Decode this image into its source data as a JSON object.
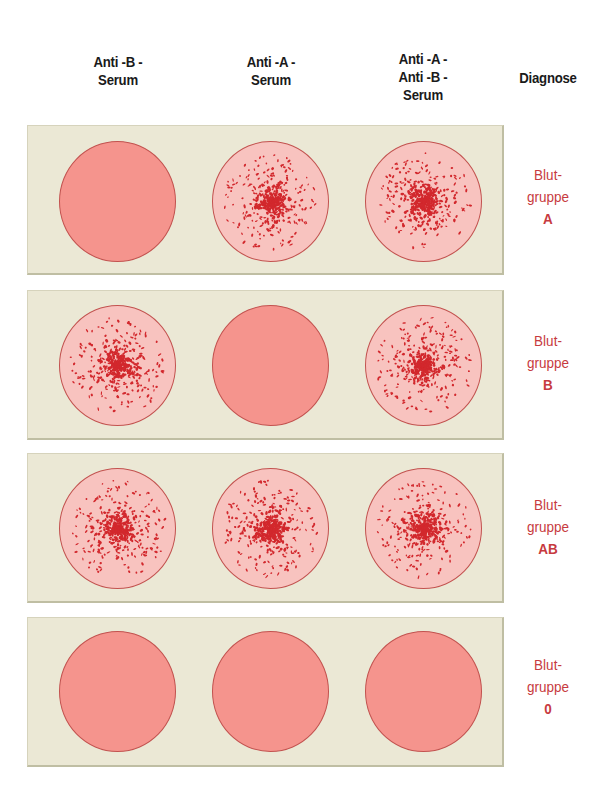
{
  "headers": {
    "col1": [
      "Anti -B -",
      "Serum"
    ],
    "col2": [
      "Anti -A -",
      "Serum"
    ],
    "col3": [
      "Anti -A -",
      "Anti -B -",
      "Serum"
    ],
    "diagnosis": "Diagnose"
  },
  "colors": {
    "panel": "#ebe8d5",
    "negative_well": "#f5948d",
    "positive_well": "#f8c3bf",
    "agglutinate": "#d2282d",
    "diagnosis_text": "#c73a40"
  },
  "rows": [
    {
      "wells": [
        {
          "serum": "Anti-B",
          "agglutination": false
        },
        {
          "serum": "Anti-A",
          "agglutination": true
        },
        {
          "serum": "Anti-A + Anti-B",
          "agglutination": true
        }
      ],
      "diagnosis": {
        "line1": "Blut-",
        "line2": "gruppe",
        "group": "A"
      }
    },
    {
      "wells": [
        {
          "serum": "Anti-B",
          "agglutination": true
        },
        {
          "serum": "Anti-A",
          "agglutination": false
        },
        {
          "serum": "Anti-A + Anti-B",
          "agglutination": true
        }
      ],
      "diagnosis": {
        "line1": "Blut-",
        "line2": "gruppe",
        "group": "B"
      }
    },
    {
      "wells": [
        {
          "serum": "Anti-B",
          "agglutination": true
        },
        {
          "serum": "Anti-A",
          "agglutination": true
        },
        {
          "serum": "Anti-A + Anti-B",
          "agglutination": true
        }
      ],
      "diagnosis": {
        "line1": "Blut-",
        "line2": "gruppe",
        "group": "AB"
      }
    },
    {
      "wells": [
        {
          "serum": "Anti-B",
          "agglutination": false
        },
        {
          "serum": "Anti-A",
          "agglutination": false
        },
        {
          "serum": "Anti-A + Anti-B",
          "agglutination": false
        }
      ],
      "diagnosis": {
        "line1": "Blut-",
        "line2": "gruppe",
        "group": "0"
      }
    }
  ]
}
